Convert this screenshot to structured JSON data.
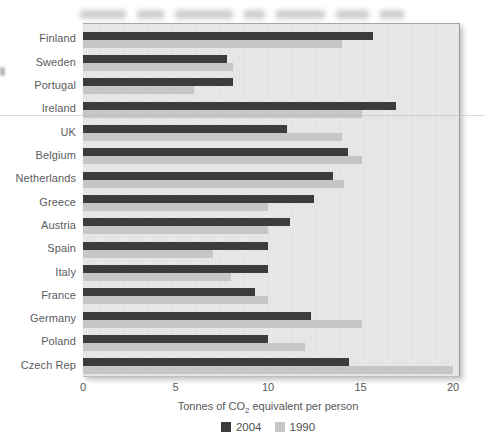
{
  "chart_data": {
    "type": "bar",
    "orientation": "horizontal",
    "title": "",
    "xlabel": "Tonnes of CO2 equivalent per person",
    "xlabel_parts": {
      "pre": "Tonnes of CO",
      "sub": "2",
      "post": " equivalent per person"
    },
    "xlim": [
      0,
      20
    ],
    "xticks": [
      0,
      5,
      10,
      15,
      20
    ],
    "grid": false,
    "legend_position": "bottom-center",
    "categories": [
      "Finland",
      "Sweden",
      "Portugal",
      "Ireland",
      "UK",
      "Belgium",
      "Netherlands",
      "Greece",
      "Austria",
      "Spain",
      "Italy",
      "France",
      "Germany",
      "Poland",
      "Czech Rep"
    ],
    "series": [
      {
        "name": "2004",
        "color": "#3b3c3e",
        "values": [
          15.7,
          7.8,
          8.1,
          16.9,
          11.0,
          14.3,
          13.5,
          12.5,
          11.2,
          10.0,
          10.0,
          9.3,
          12.3,
          10.0,
          14.4
        ]
      },
      {
        "name": "1990",
        "color": "#c6c6c4",
        "values": [
          14.0,
          8.1,
          6.0,
          15.1,
          14.0,
          15.1,
          14.1,
          10.0,
          10.0,
          7.0,
          8.0,
          10.0,
          15.1,
          12.0,
          20.0
        ]
      }
    ]
  },
  "style": {
    "page_bg": "#ffffff",
    "panel_bg": "#e8e8e6",
    "panel_border": "#a6a6a4",
    "text_color": "#58595b",
    "series_2004_color": "#3b3c3e",
    "series_1990_color": "#c6c6c4"
  }
}
